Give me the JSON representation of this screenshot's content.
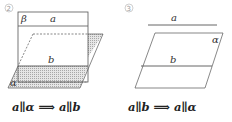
{
  "figures": [
    {
      "id": "figure-2",
      "number_label": "②",
      "labels": {
        "plane_beta": "β",
        "line_a": "a",
        "line_b": "b",
        "plane_alpha": "α"
      },
      "formula": "a∥α ⟹ a∥b"
    },
    {
      "id": "figure-3",
      "number_label": "③",
      "labels": {
        "line_a": "a",
        "line_b": "b",
        "plane_alpha": "α"
      },
      "formula": "a∥b ⟹ a∥α"
    }
  ],
  "colors": {
    "line": "#555555",
    "shade": "#bdbdbd",
    "text": "#222222"
  }
}
